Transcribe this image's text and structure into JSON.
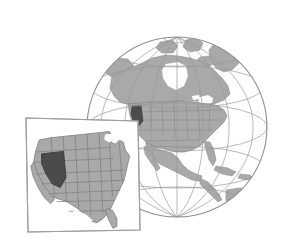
{
  "figure": {
    "title": "Locator map: Nevada highlighted on a globe of North America with a United States inset",
    "type": "locator-map-illustration",
    "background_color": "#ffffff",
    "canvas": {
      "width": 282,
      "height": 241
    }
  },
  "palette": {
    "land_fill": "#a9a9a9",
    "land_stroke": "#8a8a8a",
    "state_stroke": "#7d7d7d",
    "highlight_fill": "#4b4b4b",
    "highlight_stroke": "#3a3a3a",
    "graticule_stroke": "#9a9a9a",
    "globe_outline": "#8f8f8f",
    "inset_border": "#9e9e9e",
    "inset_fill": "#ffffff",
    "ocean_fill": "#ffffff"
  },
  "globe": {
    "label": "globe-north-america",
    "center": {
      "x": 177,
      "y": 127
    },
    "radius": 90,
    "outline_width": 1,
    "graticule": {
      "visible": true,
      "meridian_count": 7,
      "parallel_count": 5,
      "pole_visible": true,
      "pole_label": "north-pole-convergence"
    },
    "landmasses": [
      "Greenland",
      "Canadian Arctic Archipelago",
      "Alaska",
      "Canada",
      "United States",
      "Mexico",
      "Central America",
      "Cuba",
      "Caribbean islands",
      "northern South America"
    ],
    "highlighted_region": {
      "name": "Nevada",
      "fill": "#4b4b4b"
    }
  },
  "inset": {
    "label": "united-states-inset",
    "rotation_deg": -1.5,
    "corners": {
      "top_left": {
        "x": 26,
        "y": 118
      },
      "top_right": {
        "x": 138,
        "y": 121
      },
      "bottom_right": {
        "x": 140,
        "y": 230
      },
      "bottom_left": {
        "x": 28,
        "y": 232
      }
    },
    "border_color": "#9e9e9e",
    "fill": "#ffffff",
    "map_subject": "Contiguous United States",
    "state_borders_visible": true,
    "highlighted_region": {
      "name": "Nevada",
      "fill": "#4b4b4b"
    }
  },
  "legend": {
    "visible": false,
    "entries": []
  },
  "annotations": {
    "visible_text": [],
    "note": "No text labels are rendered in the image."
  }
}
